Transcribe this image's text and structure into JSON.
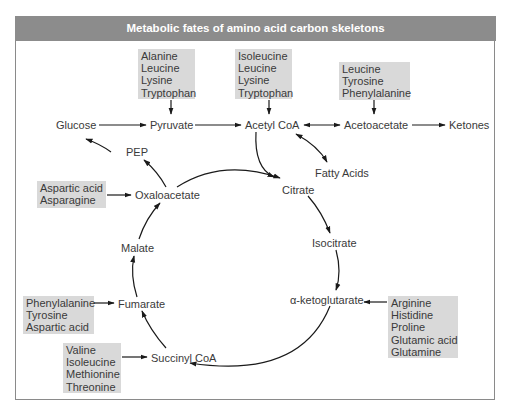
{
  "title": "Metabolic fates of amino acid carbon skeletons",
  "colors": {
    "title_bar": "#8c8c8c",
    "title_text": "#ffffff",
    "box_fill": "#d9d9d9",
    "text": "#3a3a3a",
    "arrow": "#1a1a1a",
    "frame_border": "#8a8a8a"
  },
  "nodes": {
    "glucose": "Glucose",
    "pyruvate": "Pyruvate",
    "acetyl_coa": "Acetyl CoA",
    "acetoacetate": "Acetoacetate",
    "ketones": "Ketones",
    "pep": "PEP",
    "fatty_acids": "Fatty Acids",
    "oxaloacetate": "Oxaloacetate",
    "citrate": "Citrate",
    "malate": "Malate",
    "isocitrate": "Isocitrate",
    "fumarate": "Fumarate",
    "alpha_ketoglutarate": "α-ketoglutarate",
    "succinyl_coa": "Succinyl CoA"
  },
  "amino_acid_groups": {
    "to_pyruvate": [
      "Alanine",
      "Leucine",
      "Lysine",
      "Tryptophan"
    ],
    "to_acetyl_coa": [
      "Isoleucine",
      "Leucine",
      "Lysine",
      "Tryptophan"
    ],
    "to_acetoacetate": [
      "Leucine",
      "Tyrosine",
      "Phenylalanine"
    ],
    "to_oxaloacetate": [
      "Aspartic acid",
      "Asparagine"
    ],
    "to_fumarate": [
      "Phenylalanine",
      "Tyrosine",
      "Aspartic acid"
    ],
    "to_succinyl_coa": [
      "Valine",
      "Isoleucine",
      "Methionine",
      "Threonine"
    ],
    "to_alpha_ketoglutarate": [
      "Arginine",
      "Histidine",
      "Proline",
      "Glutamic acid",
      "Glutamine"
    ]
  }
}
